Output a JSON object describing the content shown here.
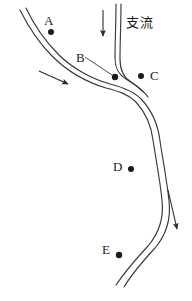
{
  "figure": {
    "type": "river-course-diagram",
    "background_color": "#ffffff",
    "ink_color": "#2b2b2b",
    "width": 192,
    "height": 301
  },
  "annotations": {
    "tributary_label": "支流"
  },
  "points": [
    {
      "id": "A",
      "label": "A",
      "label_x": 44,
      "label_y": 14,
      "dot_x": 51,
      "dot_y": 32,
      "dot_r": 3.0
    },
    {
      "id": "B",
      "label": "B",
      "label_x": 76,
      "label_y": 51,
      "dot_x": 115,
      "dot_y": 77,
      "dot_r": 3.2
    },
    {
      "id": "C",
      "label": "C",
      "label_x": 150,
      "label_y": 69,
      "dot_x": 141,
      "dot_y": 76,
      "dot_r": 3.0
    },
    {
      "id": "D",
      "label": "D",
      "label_x": 113,
      "label_y": 160,
      "dot_x": 131,
      "dot_y": 169,
      "dot_r": 3.0
    },
    {
      "id": "E",
      "label": "E",
      "label_x": 102,
      "label_y": 243,
      "dot_x": 119,
      "dot_y": 255,
      "dot_r": 3.2
    }
  ],
  "arrows": [
    {
      "id": "tributary-flow-arrow",
      "direction": "down",
      "x1": 103,
      "y1": 10,
      "x2": 103,
      "y2": 38
    },
    {
      "id": "upper-main-flow-arrow",
      "direction": "down-right",
      "x1": 39,
      "y1": 71,
      "x2": 70,
      "y2": 85
    },
    {
      "id": "lower-main-flow-arrow",
      "direction": "down",
      "x1": 168,
      "y1": 190,
      "x2": 178,
      "y2": 232
    }
  ],
  "channels": {
    "main_river_left_bank": "M 20,10 C 27,24 38,42 52,56 C 66,70 86,82 106,88 C 118,91 128,94 136,102 C 145,112 151,124 153,140 C 156,160 160,180 162,200 C 164,218 160,232 148,246 C 136,259 126,270 116,285",
    "main_river_right_bank": "M 26,8 C 33,23 45,41 59,55 C 72,68 92,79 110,84 C 122,87 134,91 142,100 C 152,111 158,124 160,141 C 163,161 167,181 169,201 C 171,219 167,234 155,248 C 143,261 133,272 124,287",
    "tributary_left_bank": "M 116,4 C 116,22 115,42 115,58 C 115,68 118,74 126,79 C 132,83 138,86 143,92",
    "tributary_right_bank": "M 121,4 C 121,22 120,43 120,59 C 120,70 123,77 131,82 C 137,86 143,90 148,97",
    "b_leader_line": "M 85,57 L 112,75"
  }
}
